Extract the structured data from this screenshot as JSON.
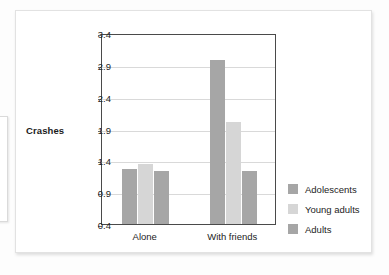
{
  "chart_data": {
    "type": "bar",
    "title": "",
    "xlabel": "",
    "ylabel": "Crashes",
    "categories": [
      "Alone",
      "With friends"
    ],
    "series": [
      {
        "name": "Adolescents",
        "color": "#a6a6a6",
        "values": [
          1.27,
          2.97
        ]
      },
      {
        "name": "Young adults",
        "color": "#d6d6d6",
        "values": [
          1.35,
          2.0
        ]
      },
      {
        "name": "Adults",
        "color": "#a6a6a6",
        "values": [
          1.23,
          1.23
        ]
      }
    ],
    "ylim": [
      0.4,
      3.4
    ],
    "yticks": [
      "0.4",
      "0.9",
      "1.4",
      "1.9",
      "2.4",
      "2.9",
      "3.4"
    ],
    "ytick_values": [
      0.4,
      0.9,
      1.4,
      1.9,
      2.4,
      2.9,
      3.4
    ],
    "grid": true,
    "legend_position": "right"
  },
  "legend": {
    "items": [
      {
        "label": "Adolescents",
        "color": "#a6a6a6"
      },
      {
        "label": "Young adults",
        "color": "#d6d6d6"
      },
      {
        "label": "Adults",
        "color": "#a6a6a6"
      }
    ]
  },
  "colors": {
    "axis": "#4a4a4a",
    "grid": "#d9d9d9",
    "text": "#232323",
    "card": "#ffffff",
    "page": "#fdfdfd"
  }
}
